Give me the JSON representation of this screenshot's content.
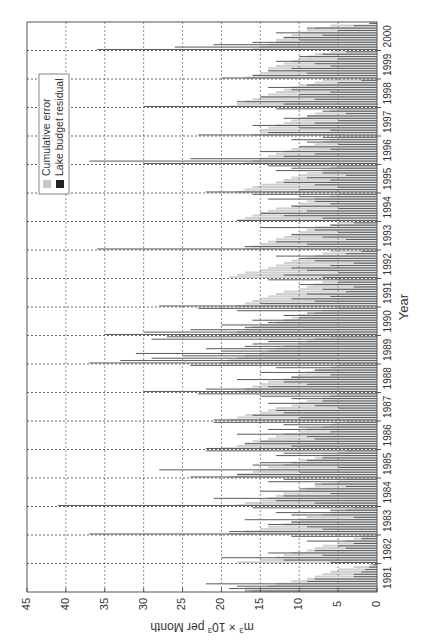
{
  "chart_data": {
    "type": "bar",
    "orientation_note": "figure rotated 90 degrees clockwise on page",
    "title": "",
    "xlabel": "Year",
    "ylabel": "m³ × 10³ per Month",
    "ylabel_parts": {
      "base": "m",
      "sup1": "3",
      "mid": " × 10",
      "sup2": "3",
      "tail": " per Month"
    },
    "ylim": [
      0,
      45
    ],
    "yticks": [
      0,
      5,
      10,
      15,
      20,
      25,
      30,
      35,
      40,
      45
    ],
    "xtick_labels": [
      "1981",
      "1982",
      "1983",
      "1984",
      "1985",
      "1986",
      "1987",
      "1988",
      "1989",
      "1990",
      "1991",
      "1992",
      "1993",
      "1994",
      "1995",
      "1996",
      "1997",
      "1998",
      "1999",
      "2000"
    ],
    "x_range_years": [
      1981,
      2000
    ],
    "grid": true,
    "legend_position": "upper left (rotated)",
    "legend": [
      {
        "name": "Cumulative error",
        "color": "#c8c8c8"
      },
      {
        "name": "Lake budget residual",
        "color": "#222222"
      }
    ],
    "series": [
      {
        "name": "Cumulative error",
        "color": "#cfcfcf",
        "values_by_year": {
          "1981": [
            16,
            17,
            14,
            13,
            11,
            9,
            8,
            7,
            6,
            5,
            3,
            1
          ],
          "1982": [
            18,
            15,
            13,
            12,
            11,
            9,
            8,
            7,
            5,
            4,
            3,
            2
          ],
          "1983": [
            19,
            17,
            15,
            14,
            12,
            11,
            10,
            9,
            7,
            6,
            4,
            3
          ],
          "1984": [
            18,
            17,
            15,
            14,
            13,
            12,
            10,
            9,
            8,
            7,
            5,
            4
          ],
          "1985": [
            19,
            18,
            16,
            15,
            14,
            12,
            11,
            10,
            8,
            7,
            5,
            4
          ],
          "1986": [
            20,
            18,
            17,
            16,
            14,
            13,
            12,
            10,
            9,
            7,
            6,
            4
          ],
          "1987": [
            19,
            18,
            17,
            15,
            14,
            13,
            11,
            10,
            9,
            7,
            6,
            5
          ],
          "1988": [
            18,
            17,
            16,
            15,
            14,
            12,
            11,
            10,
            9,
            8,
            6,
            5
          ],
          "1989": [
            20,
            19,
            18,
            17,
            15,
            14,
            13,
            12,
            10,
            9,
            8,
            6
          ],
          "1990": [
            19,
            18,
            17,
            16,
            15,
            13,
            12,
            11,
            10,
            8,
            7,
            5
          ],
          "1991": [
            18,
            17,
            16,
            15,
            14,
            13,
            12,
            10,
            9,
            8,
            7,
            5
          ],
          "1992": [
            19,
            18,
            17,
            15,
            14,
            13,
            12,
            11,
            9,
            8,
            7,
            6
          ],
          "1993": [
            17,
            16,
            15,
            14,
            13,
            12,
            11,
            10,
            9,
            8,
            6,
            5
          ],
          "1994": [
            18,
            17,
            16,
            15,
            14,
            13,
            11,
            10,
            9,
            8,
            6,
            5
          ],
          "1995": [
            18,
            17,
            16,
            15,
            13,
            12,
            11,
            10,
            9,
            7,
            6,
            5
          ],
          "1996": [
            17,
            16,
            15,
            14,
            13,
            12,
            11,
            10,
            8,
            7,
            6,
            5
          ],
          "1997": [
            16,
            15,
            15,
            14,
            13,
            12,
            11,
            10,
            9,
            8,
            6,
            5
          ],
          "1998": [
            19,
            18,
            17,
            16,
            15,
            14,
            13,
            12,
            11,
            10,
            8,
            7
          ],
          "1999": [
            17,
            16,
            15,
            14,
            14,
            13,
            12,
            11,
            10,
            9,
            8,
            6
          ],
          "2000": [
            16,
            15,
            14,
            13,
            13,
            12,
            11,
            10,
            9,
            8,
            6,
            1
          ]
        }
      },
      {
        "name": "Lake budget residual",
        "color": "#5a5a5a",
        "values_by_year": {
          "1981": [
            17,
            19,
            18,
            22,
            9,
            8,
            3,
            3,
            2,
            1.5,
            1,
            0.5
          ],
          "1982": [
            6,
            12,
            20,
            7,
            14,
            8,
            4,
            5,
            3,
            9,
            2,
            11
          ],
          "1983": [
            37,
            19,
            7,
            9,
            14,
            11,
            17,
            3,
            11,
            13,
            6,
            16
          ],
          "1984": [
            41,
            8,
            13,
            21,
            12,
            6,
            15,
            10,
            4,
            8,
            14,
            12
          ],
          "1985": [
            24,
            18,
            10,
            28,
            5,
            16,
            15,
            9,
            7,
            13,
            12,
            22
          ],
          "1986": [
            22,
            11,
            17,
            15,
            8,
            9,
            18,
            6,
            14,
            10,
            12,
            21
          ],
          "1987": [
            21,
            10,
            16,
            12,
            13,
            5,
            8,
            14,
            7,
            11,
            15,
            23
          ],
          "1988": [
            30,
            22,
            14,
            9,
            12,
            18,
            11,
            6,
            15,
            8,
            13,
            24
          ],
          "1989": [
            37,
            33,
            29,
            25,
            31,
            20,
            22,
            17,
            16,
            14,
            29,
            27
          ],
          "1990": [
            35,
            30,
            24,
            17,
            20,
            14,
            16,
            10,
            12,
            9,
            18,
            23
          ],
          "1991": [
            28,
            15,
            8,
            11,
            6,
            9,
            4,
            7,
            3,
            10,
            5,
            14
          ],
          "1992": [
            7,
            12,
            5,
            9,
            11,
            6,
            3,
            8,
            10,
            13,
            4,
            2
          ],
          "1993": [
            36,
            17,
            9,
            13,
            4,
            7,
            11,
            5,
            8,
            15,
            6,
            3
          ],
          "1994": [
            18,
            7,
            12,
            15,
            9,
            5,
            11,
            6,
            8,
            14,
            10,
            16
          ],
          "1995": [
            22,
            10,
            5,
            8,
            12,
            6,
            9,
            4,
            7,
            13,
            11,
            14
          ],
          "1996": [
            30,
            37,
            24,
            12,
            8,
            15,
            6,
            10,
            5,
            9,
            11,
            7
          ],
          "1997": [
            23,
            14,
            6,
            10,
            16,
            8,
            5,
            12,
            9,
            4,
            7,
            13
          ],
          "1998": [
            30,
            12,
            18,
            8,
            15,
            10,
            6,
            11,
            14,
            9,
            5,
            2
          ],
          "1999": [
            20,
            16,
            9,
            14,
            11,
            6,
            8,
            13,
            5,
            10,
            7,
            4
          ],
          "2000": [
            36,
            26,
            21,
            16,
            10,
            12,
            7,
            13,
            5,
            9,
            3,
            1
          ]
        }
      }
    ]
  }
}
